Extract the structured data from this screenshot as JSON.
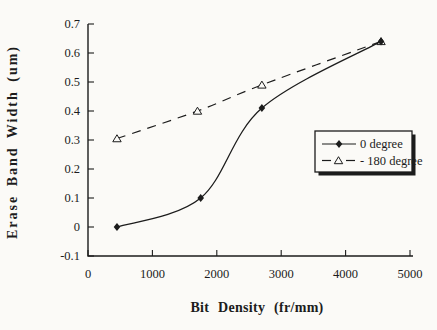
{
  "figure": {
    "background": "#fbfaf7",
    "ink": "#1c1c1c"
  },
  "chart_data": {
    "type": "line",
    "title": "",
    "xlabel": "Bit Density (fr/mm)",
    "ylabel": "Erase Band Width (um)",
    "xlim": [
      0,
      5000
    ],
    "ylim": [
      -0.1,
      0.7
    ],
    "x_ticks": [
      0,
      1000,
      2000,
      3000,
      4000,
      5000
    ],
    "x_tick_labels": [
      "0",
      "1000",
      "2000",
      "3000",
      "4000",
      "5000"
    ],
    "y_ticks": [
      -0.1,
      0,
      0.1,
      0.2,
      0.3,
      0.4,
      0.5,
      0.6,
      0.7
    ],
    "y_tick_labels": [
      "-0.1",
      "0",
      "0.1",
      "0.2",
      "0.3",
      "0.4",
      "0.5",
      "0.6",
      "0.7"
    ],
    "grid": false,
    "legend": {
      "position": "middle-right",
      "border": true,
      "drop_shadow": true
    },
    "series": [
      {
        "name": "0 degree",
        "line_style": "solid",
        "marker": "filled-diamond",
        "points": [
          [
            450,
            0.0
          ],
          [
            1750,
            0.1
          ],
          [
            2700,
            0.41
          ],
          [
            4550,
            0.64
          ]
        ]
      },
      {
        "name": "- 180 degree",
        "line_style": "dashed",
        "marker": "open-triangle",
        "points": [
          [
            450,
            0.305
          ],
          [
            1700,
            0.4
          ],
          [
            2700,
            0.49
          ],
          [
            4550,
            0.64
          ]
        ]
      }
    ]
  }
}
